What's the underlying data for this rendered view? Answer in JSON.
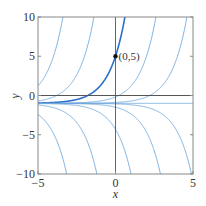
{
  "chart_data": {
    "type": "line",
    "title": "",
    "xlabel": "x",
    "ylabel": "y",
    "xlim": [
      -5,
      5
    ],
    "ylim": [
      -10,
      10
    ],
    "xticks": [
      -5,
      0,
      5
    ],
    "yticks": [
      -10,
      -5,
      0,
      5,
      10
    ],
    "xtick_labels": [
      "−5",
      "0",
      "5"
    ],
    "ytick_labels": [
      "−10",
      "−5",
      "0",
      "5",
      "10"
    ],
    "grid": false,
    "legend": null,
    "family": "y = C e^x - 1",
    "series": [
      {
        "name": "C=6e^4",
        "C": 327.6,
        "highlight": false
      },
      {
        "name": "C=6e^2",
        "C": 44.3,
        "highlight": false
      },
      {
        "name": "C=6 (through (0,5))",
        "C": 6,
        "highlight": true
      },
      {
        "name": "C=6e^-2",
        "C": 0.812,
        "highlight": false
      },
      {
        "name": "C=6e^-4",
        "C": 0.11,
        "highlight": false
      },
      {
        "name": "equilibrium y=-1",
        "C": 0,
        "highlight": false
      },
      {
        "name": "C=-9e^3.15",
        "C": -210,
        "highlight": false
      },
      {
        "name": "C=-9e^1.2",
        "C": -29.9,
        "highlight": false
      },
      {
        "name": "C=-9e^-1",
        "C": -3.31,
        "highlight": false
      },
      {
        "name": "C=-9e^-2.9",
        "C": -0.496,
        "highlight": false
      },
      {
        "name": "C=-9e^-4.9",
        "C": -0.0672,
        "highlight": false
      }
    ],
    "annotations": [
      {
        "text": "(0,5)",
        "x": 0,
        "y": 5,
        "marker": "dot"
      }
    ],
    "colors": {
      "curve": "#6fa8dc",
      "highlight": "#2a6fc9",
      "axis": "#555555",
      "frame": "#888888",
      "marker": "#111111"
    }
  }
}
